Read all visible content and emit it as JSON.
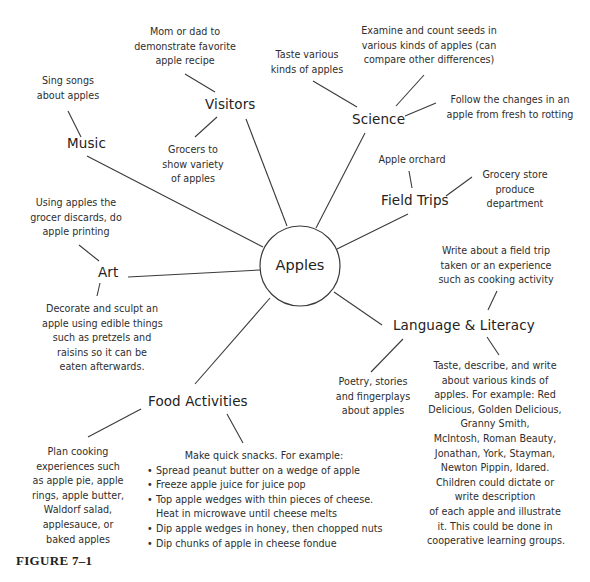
{
  "diagram": {
    "type": "concept-web",
    "center": {
      "label": "Apples"
    },
    "categories": [
      {
        "id": "visitors",
        "label": "Visitors",
        "notes": [
          [
            "Mom or dad to",
            "demonstrate favorite",
            "apple recipe"
          ],
          [
            "Grocers to",
            "show variety",
            "of apples"
          ]
        ]
      },
      {
        "id": "science",
        "label": "Science",
        "notes": [
          [
            "Taste various",
            "kinds of apples"
          ],
          [
            "Examine and count seeds in",
            "various kinds of apples (can",
            "compare other differences)"
          ],
          [
            "Follow the changes in an",
            "apple from fresh to rotting"
          ]
        ]
      },
      {
        "id": "music",
        "label": "Music",
        "notes": [
          [
            "Sing songs",
            "about apples"
          ]
        ]
      },
      {
        "id": "field-trips",
        "label": "Field Trips",
        "notes": [
          [
            "Apple orchard"
          ],
          [
            "Grocery store",
            "produce",
            "department"
          ]
        ]
      },
      {
        "id": "art",
        "label": "Art",
        "notes": [
          [
            "Using apples the",
            "grocer discards, do",
            "apple printing"
          ],
          [
            "Decorate and sculpt an",
            "apple using edible things",
            "such as pretzels and",
            "raisins so it can be",
            "eaten afterwards."
          ]
        ]
      },
      {
        "id": "language-literacy",
        "label": "Language & Literacy",
        "notes": [
          [
            "Write about a field trip",
            "taken or an experience",
            "such as cooking activity"
          ],
          [
            "Poetry, stories",
            "and fingerplays",
            "about apples"
          ],
          [
            "Taste, describe, and write",
            "about various kinds of",
            "apples. For example: Red",
            "Delicious, Golden Delicious,",
            "Granny Smith,",
            "McIntosh, Roman Beauty,",
            "Jonathan, York, Stayman,",
            "Newton Pippin, Idared.",
            "Children could dictate or",
            "write description",
            "of each apple and illustrate",
            "it.  This could be done in",
            "cooperative learning groups."
          ]
        ]
      },
      {
        "id": "food-activities",
        "label": "Food Activities",
        "notes": [
          [
            "Plan cooking",
            "experiences such",
            "as apple pie, apple",
            "rings, apple butter,",
            "Waldorf salad,",
            "applesauce, or",
            "baked apples"
          ]
        ],
        "snacks": {
          "intro": "Make quick snacks. For example:",
          "items": [
            "Spread peanut butter on a wedge of apple",
            "Freeze apple juice for juice pop",
            "Top apple wedges with thin pieces of cheese. Heat in microwave until cheese melts",
            "Dip apple wedges in honey, then chopped nuts",
            "Dip chunks of apple in cheese fondue"
          ],
          "item3_lines": [
            "Top apple wedges with thin pieces of cheese.",
            "Heat in microwave until cheese melts"
          ]
        }
      }
    ]
  },
  "caption": "FIGURE 7–1"
}
